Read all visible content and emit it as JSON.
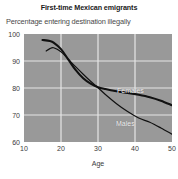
{
  "chart_data": {
    "type": "line",
    "title": "First-time Mexican emigrants",
    "subtitle": "Percentage entering destination illegally",
    "xlabel": "Age",
    "ylabel": "",
    "xlim": [
      10,
      50
    ],
    "ylim": [
      60,
      100
    ],
    "xticks": [
      10,
      20,
      30,
      40,
      50
    ],
    "yticks": [
      60,
      70,
      80,
      90,
      100
    ],
    "grid": true,
    "legend_position": "inline-annotation",
    "plot_background": "#999999",
    "gridline_color": "#e6e6e6",
    "line_color": "#111111",
    "series": [
      {
        "name": "Females",
        "label_color": "#f2f2f2",
        "line_width": 2.1,
        "x": [
          15,
          17,
          18,
          20,
          22,
          24,
          26,
          28,
          30,
          32,
          35,
          38,
          41,
          44,
          47,
          50
        ],
        "values": [
          97.8,
          97.4,
          96.8,
          94.4,
          90.5,
          86.6,
          83.6,
          81.6,
          80.3,
          79.6,
          78.8,
          78.2,
          77.5,
          76.6,
          75.3,
          73.6
        ]
      },
      {
        "name": "Males",
        "label_color": "#f2f2f2",
        "line_width": 1.2,
        "x": [
          16,
          17,
          18,
          20,
          22,
          24,
          26,
          28,
          30,
          32,
          35,
          38,
          41,
          44,
          47,
          50
        ],
        "values": [
          93.7,
          94.6,
          94.9,
          93.4,
          90.6,
          87.8,
          85.1,
          82.5,
          80.1,
          77.6,
          74.2,
          71.3,
          68.9,
          67.3,
          65.2,
          62.9
        ]
      }
    ]
  }
}
